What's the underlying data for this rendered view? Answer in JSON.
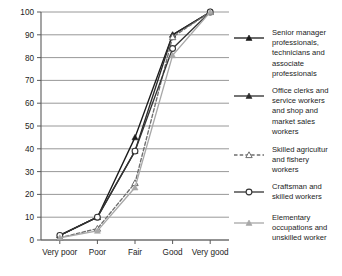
{
  "chart_data": {
    "type": "line",
    "title": "",
    "subtitle": "",
    "xlabel": "",
    "ylabel": "",
    "categories": [
      "Very poor",
      "Poor",
      "Fair",
      "Good",
      "Very good"
    ],
    "ylim": [
      0,
      100
    ],
    "yticks": [
      0,
      10,
      20,
      30,
      40,
      50,
      60,
      70,
      80,
      90,
      100
    ],
    "grid": true,
    "legend_position": "right",
    "series": [
      {
        "name": "Senior manager professionals, technicians and associate professionals",
        "values": [
          2,
          10,
          45,
          90,
          100
        ],
        "marker": "filled-triangle",
        "line_style": "solid",
        "color": "#1a1a1a"
      },
      {
        "name": "Office clerks and service workers and shop and market sales workers",
        "values": [
          2,
          10,
          39,
          90,
          100
        ],
        "marker": "filled-triangle",
        "line_style": "solid",
        "color": "#2b2b2b"
      },
      {
        "name": "Skilled agricultur and fishery workers",
        "values": [
          1,
          5,
          25,
          89,
          100
        ],
        "marker": "open-triangle",
        "line_style": "dashed",
        "color": "#6e6e6e"
      },
      {
        "name": "Craftsman and skilled workers",
        "values": [
          2,
          10,
          39,
          84,
          100
        ],
        "marker": "open-circle",
        "line_style": "solid",
        "color": "#333333"
      },
      {
        "name": "Elementary occupations and unskilled worker",
        "values": [
          1,
          4,
          23,
          81,
          100
        ],
        "marker": "filled-triangle",
        "line_style": "solid",
        "color": "#a8a8a8"
      }
    ]
  },
  "axes": {
    "y_tick_labels": [
      "0",
      "10",
      "20",
      "30",
      "40",
      "50",
      "60",
      "70",
      "80",
      "90",
      "100"
    ],
    "x_tick_labels": [
      "Very poor",
      "Poor",
      "Fair",
      "Good",
      "Very good"
    ]
  },
  "legend": {
    "entries": [
      {
        "label": "Senior manager professionals, technicians and associate professionals"
      },
      {
        "label": "Office clerks and service workers and shop and market sales workers"
      },
      {
        "label": "Skilled agricultur and fishery workers"
      },
      {
        "label": "Craftsman and skilled workers"
      },
      {
        "label": "Elementary occupations and unskilled worker"
      }
    ]
  },
  "colors": {
    "gridline": "#8c8c8c",
    "axis": "#5a5a5a",
    "text": "#1c1c1c",
    "background": "#ffffff"
  }
}
